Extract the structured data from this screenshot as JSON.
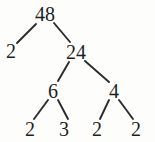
{
  "diagram": {
    "type": "factor-tree",
    "background_color": "#fdfdfc",
    "ink_color": "#1f1f1f",
    "edge_color": "#2b2b2b",
    "nodes": [
      {
        "id": "n48",
        "label": "48",
        "x": 45,
        "y": 14,
        "level": 0
      },
      {
        "id": "n2a",
        "label": "2",
        "x": 11,
        "y": 51,
        "level": 1
      },
      {
        "id": "n24",
        "label": "24",
        "x": 76,
        "y": 52,
        "level": 1
      },
      {
        "id": "n6",
        "label": "6",
        "x": 53,
        "y": 91,
        "level": 2
      },
      {
        "id": "n4",
        "label": "4",
        "x": 114,
        "y": 91,
        "level": 2
      },
      {
        "id": "n2b",
        "label": "2",
        "x": 30,
        "y": 129,
        "level": 3
      },
      {
        "id": "n3",
        "label": "3",
        "x": 64,
        "y": 129,
        "level": 3
      },
      {
        "id": "n2c",
        "label": "2",
        "x": 97,
        "y": 129,
        "level": 3
      },
      {
        "id": "n2d",
        "label": "2",
        "x": 136,
        "y": 129,
        "level": 3
      }
    ],
    "edges": [
      {
        "id": "e48-2a",
        "from": "n48",
        "to": "n2a",
        "x1": 36,
        "y1": 24,
        "x2": 17,
        "y2": 43
      },
      {
        "id": "e48-24",
        "from": "n48",
        "to": "n24",
        "x1": 54,
        "y1": 23,
        "x2": 70,
        "y2": 42
      },
      {
        "id": "e24-6",
        "from": "n24",
        "to": "n6",
        "x1": 69,
        "y1": 62,
        "x2": 58,
        "y2": 81
      },
      {
        "id": "e24-4",
        "from": "n24",
        "to": "n4",
        "x1": 85,
        "y1": 61,
        "x2": 109,
        "y2": 82
      },
      {
        "id": "e6-2b",
        "from": "n6",
        "to": "n2b",
        "x1": 48,
        "y1": 100,
        "x2": 34,
        "y2": 119
      },
      {
        "id": "e6-3",
        "from": "n6",
        "to": "n3",
        "x1": 58,
        "y1": 100,
        "x2": 68,
        "y2": 119
      },
      {
        "id": "e4-2c",
        "from": "n4",
        "to": "n2c",
        "x1": 109,
        "y1": 100,
        "x2": 100,
        "y2": 119
      },
      {
        "id": "e4-2d",
        "from": "n4",
        "to": "n2d",
        "x1": 119,
        "y1": 100,
        "x2": 133,
        "y2": 119
      }
    ]
  }
}
